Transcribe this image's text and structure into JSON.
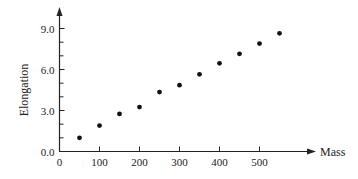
{
  "chart_data": {
    "type": "scatter",
    "title": "",
    "xlabel": "Mass",
    "ylabel": "Elongation",
    "x": [
      50,
      100,
      150,
      200,
      250,
      300,
      350,
      400,
      450,
      500,
      550
    ],
    "y": [
      1.0,
      1.9,
      2.75,
      3.25,
      4.35,
      4.85,
      5.65,
      6.45,
      7.15,
      7.9,
      8.65
    ],
    "xlim": [
      0,
      640
    ],
    "ylim": [
      0,
      10.5
    ],
    "xticks": [
      0,
      100,
      200,
      300,
      400,
      500
    ],
    "xtick_labels": [
      "0",
      "100",
      "200",
      "300",
      "400",
      "500"
    ],
    "yticks": [
      0,
      3,
      6,
      9
    ],
    "ytick_labels": [
      "0.0",
      "3.0",
      "6.0",
      "9.0"
    ],
    "y_minor_step": 1.0,
    "grid": false,
    "legend": null,
    "marker_color": "#111111"
  }
}
